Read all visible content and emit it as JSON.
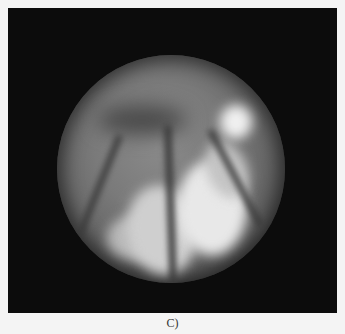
{
  "figure": {
    "caption": "C)",
    "panel_background": "#0c0c0c",
    "page_background": "#f4f4f4",
    "content": "grayscale circular endoscopic view"
  }
}
